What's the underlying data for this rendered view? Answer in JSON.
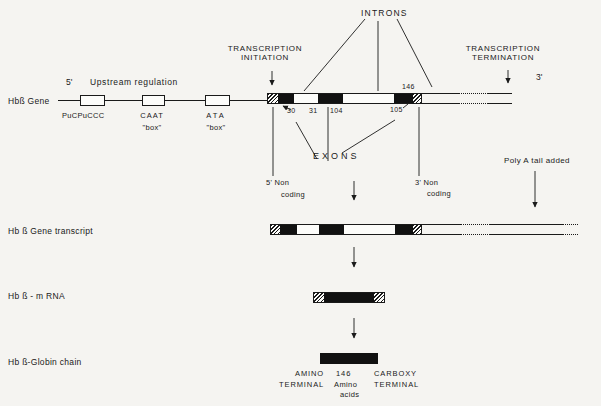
{
  "colors": {
    "ink": "#1a1a1a",
    "paper": "#f5f4f1"
  },
  "labels": {
    "introns": "INTRONS",
    "transcription_initiation_1": "TRANSCRIPTION",
    "transcription_initiation_2": "INITIATION",
    "transcription_termination_1": "TRANSCRIPTION",
    "transcription_termination_2": "TERMINATION",
    "five_prime": "5'",
    "three_prime": "3'",
    "upstream_regulation": "Upstream regulation",
    "exons": "EXONS",
    "five_noncoding_1": "5' Non",
    "five_noncoding_2": "coding",
    "three_noncoding_1": "3' Non",
    "three_noncoding_2": "coding",
    "poly_a": "Poly A tail added"
  },
  "rows": {
    "gene": {
      "label": "Hbß Gene"
    },
    "transcript": {
      "label": "Hb ß Gene transcript"
    },
    "mrna": {
      "label": "Hb ß - m RNA"
    },
    "globin": {
      "label": "Hb ß-Globin chain"
    }
  },
  "upstream": [
    {
      "name": "PuCPuCCC",
      "sub": ""
    },
    {
      "name": "CAAT",
      "sub": "\"box\""
    },
    {
      "name": "ATA",
      "sub": "\"box\""
    }
  ],
  "codon_numbers": {
    "n30": "30",
    "n31": "31",
    "n104": "104",
    "n105": "105",
    "n146": "146"
  },
  "terminal": {
    "amino_1": "AMINO",
    "amino_2": "TERMINAL",
    "count_1": "146",
    "count_2": "Amino",
    "count_3": "acids",
    "carboxy_1": "CARBOXY",
    "carboxy_2": "TERMINAL"
  },
  "bars": {
    "gene": [
      {
        "type": "hatch",
        "w": 10
      },
      {
        "type": "exon",
        "w": 16
      },
      {
        "type": "intron",
        "w": 24
      },
      {
        "type": "exon",
        "w": 25
      },
      {
        "type": "intron",
        "w": 51
      },
      {
        "type": "exon",
        "w": 19
      },
      {
        "type": "hatch",
        "w": 10
      }
    ],
    "transcript": [
      {
        "type": "hatch",
        "w": 9
      },
      {
        "type": "exon",
        "w": 17
      },
      {
        "type": "intron",
        "w": 22
      },
      {
        "type": "exon",
        "w": 25
      },
      {
        "type": "intron",
        "w": 51
      },
      {
        "type": "exon",
        "w": 18
      },
      {
        "type": "hatch",
        "w": 10
      }
    ],
    "mrna": [
      {
        "type": "hatch",
        "w": 10
      },
      {
        "type": "exon",
        "w": 50
      },
      {
        "type": "hatch",
        "w": 10
      }
    ]
  }
}
